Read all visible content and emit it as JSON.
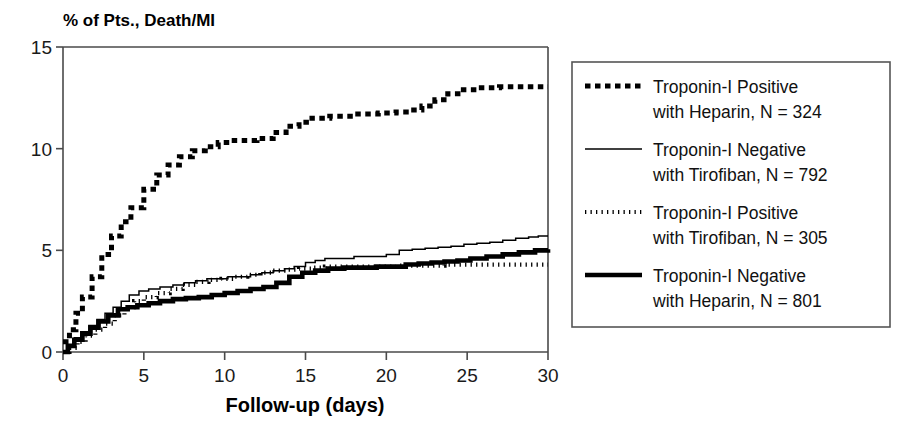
{
  "chart_data": {
    "type": "line",
    "title": "% of Pts., Death/MI",
    "xlabel": "Follow-up (days)",
    "ylabel": "% of Pts., Death/MI",
    "xlim": [
      0,
      30
    ],
    "ylim": [
      0,
      15
    ],
    "xticks": [
      0,
      5,
      10,
      15,
      20,
      25,
      30
    ],
    "yticks": [
      0,
      5,
      10,
      15
    ],
    "grid": false,
    "legend_position": "right-outside",
    "series": [
      {
        "name": "Troponin-I Positive with Heparin, N = 324",
        "label_line1": "Troponin-I Positive",
        "label_line2": "with Heparin, N = 324",
        "n": 324,
        "style": "thick-dash",
        "color": "#000000",
        "x": [
          0,
          0.4,
          0.8,
          1.2,
          1.8,
          2.4,
          3.0,
          3.6,
          4.2,
          5.0,
          5.8,
          6.5,
          7.2,
          8.0,
          8.8,
          9.6,
          10.4,
          11.2,
          12.0,
          13.0,
          13.8,
          14.6,
          15.4,
          16.5,
          18.0,
          19.5,
          20.6,
          21.5,
          22.2,
          23.0,
          23.8,
          24.6,
          25.6,
          27.0,
          28.5,
          30.0
        ],
        "y": [
          0.5,
          1.1,
          1.9,
          2.7,
          3.7,
          4.8,
          5.7,
          6.4,
          7.1,
          8.0,
          8.7,
          9.2,
          9.6,
          9.9,
          10.1,
          10.3,
          10.4,
          10.4,
          10.5,
          10.8,
          11.1,
          11.3,
          11.5,
          11.6,
          11.7,
          11.75,
          11.8,
          11.9,
          12.1,
          12.4,
          12.7,
          12.9,
          13.0,
          13.05,
          13.05,
          13.05
        ]
      },
      {
        "name": "Troponin-I Negative with Tirofiban, N = 792",
        "label_line1": "Troponin-I Negative",
        "label_line2": "with Tirofiban, N = 792",
        "n": 792,
        "style": "thin-solid",
        "color": "#000000",
        "x": [
          0,
          0.3,
          0.7,
          1.1,
          1.6,
          2.1,
          2.6,
          3.1,
          3.6,
          4.1,
          4.7,
          5.3,
          6.0,
          6.8,
          7.5,
          8.2,
          8.9,
          9.5,
          10.2,
          10.9,
          11.6,
          12.3,
          13.0,
          13.7,
          14.3,
          15.0,
          15.6,
          16.2,
          17.0,
          18.0,
          19.0,
          20.0,
          20.8,
          21.6,
          22.4,
          23.2,
          24.0,
          24.8,
          25.6,
          26.4,
          27.2,
          28.0,
          28.8,
          29.4,
          30.0
        ],
        "y": [
          0.0,
          0.3,
          0.7,
          1.0,
          1.3,
          1.6,
          1.9,
          2.2,
          2.5,
          2.8,
          3.0,
          3.1,
          3.2,
          3.3,
          3.4,
          3.5,
          3.6,
          3.6,
          3.7,
          3.7,
          3.8,
          3.9,
          4.0,
          4.1,
          4.2,
          4.4,
          4.5,
          4.6,
          4.6,
          4.7,
          4.7,
          4.8,
          5.0,
          5.05,
          5.1,
          5.15,
          5.2,
          5.3,
          5.35,
          5.4,
          5.5,
          5.6,
          5.65,
          5.7,
          5.7
        ]
      },
      {
        "name": "Troponin-I Positive with Tirofiban, N = 305",
        "label_line1": "Troponin-I Positive",
        "label_line2": "with Tirofiban, N = 305",
        "n": 305,
        "style": "fine-dot",
        "color": "#000000",
        "x": [
          0,
          0.4,
          0.9,
          1.4,
          2.0,
          2.6,
          3.2,
          3.8,
          4.4,
          5.0,
          5.8,
          6.6,
          7.4,
          8.2,
          9.0,
          9.8,
          10.6,
          11.4,
          12.2,
          13.0,
          13.8,
          14.6,
          15.4,
          16.2,
          17.2,
          18.4,
          19.6,
          20.6,
          21.6,
          22.6,
          23.6,
          24.6,
          25.6,
          26.6,
          27.6,
          28.6,
          30.0
        ],
        "y": [
          0.0,
          0.2,
          0.5,
          0.8,
          1.1,
          1.4,
          1.8,
          2.2,
          2.5,
          2.7,
          2.9,
          3.1,
          3.3,
          3.45,
          3.55,
          3.6,
          3.7,
          3.8,
          3.9,
          4.0,
          4.05,
          4.1,
          4.15,
          4.2,
          4.2,
          4.2,
          4.2,
          4.25,
          4.25,
          4.25,
          4.3,
          4.3,
          4.3,
          4.3,
          4.3,
          4.3,
          4.3
        ]
      },
      {
        "name": "Troponin-I Negative with Heparin, N = 801",
        "label_line1": "Troponin-I Negative",
        "label_line2": "with Heparin, N = 801",
        "n": 801,
        "style": "thick-solid",
        "color": "#000000",
        "x": [
          0,
          0.3,
          0.7,
          1.2,
          1.7,
          2.2,
          2.8,
          3.4,
          4.0,
          4.6,
          5.3,
          6.0,
          6.8,
          7.6,
          8.4,
          9.2,
          10.0,
          10.8,
          11.6,
          12.4,
          13.2,
          14.0,
          14.8,
          15.6,
          16.4,
          17.4,
          18.4,
          19.4,
          20.4,
          21.2,
          22.0,
          22.8,
          23.6,
          24.4,
          25.2,
          26.2,
          27.2,
          28.2,
          29.2,
          30.0
        ],
        "y": [
          0.0,
          0.3,
          0.6,
          0.9,
          1.2,
          1.5,
          1.8,
          2.1,
          2.2,
          2.3,
          2.4,
          2.5,
          2.6,
          2.65,
          2.7,
          2.8,
          2.9,
          3.0,
          3.1,
          3.2,
          3.4,
          3.7,
          3.9,
          4.0,
          4.1,
          4.15,
          4.15,
          4.2,
          4.2,
          4.3,
          4.35,
          4.4,
          4.45,
          4.5,
          4.6,
          4.7,
          4.8,
          4.9,
          5.0,
          5.05
        ]
      }
    ]
  },
  "legend": {
    "entries": [
      {
        "line1": "Troponin-I Positive",
        "line2": "with Heparin, N = 324",
        "style": "thick-dash"
      },
      {
        "line1": "Troponin-I Negative",
        "line2": "with Tirofiban, N = 792",
        "style": "thin-solid"
      },
      {
        "line1": "Troponin-I Positive",
        "line2": "with Tirofiban, N = 305",
        "style": "fine-dot"
      },
      {
        "line1": "Troponin-I Negative",
        "line2": "with Heparin, N = 801",
        "style": "thick-solid"
      }
    ]
  },
  "colors": {
    "ink": "#000000",
    "axis": "#4a4a4a",
    "background": "#ffffff"
  }
}
